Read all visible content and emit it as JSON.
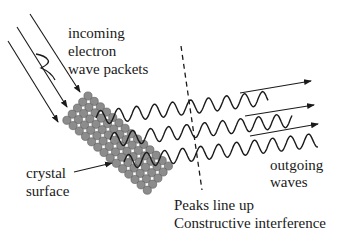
{
  "labels": {
    "incoming": [
      "incoming",
      "electron",
      "wave packets"
    ],
    "crystal": [
      "crystal",
      "surface"
    ],
    "outgoing": [
      "outgoing",
      "waves"
    ],
    "peaks": [
      "Peaks line up",
      "Constructive interference"
    ]
  },
  "colors": {
    "ink": "#1a1a1a",
    "atom_fill": "#8c8c8c",
    "atom_stroke": "#5a5a5a"
  }
}
